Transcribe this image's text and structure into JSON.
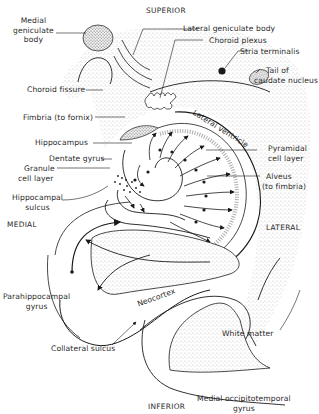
{
  "diagram": {
    "orientation": {
      "superior": "SUPERIOR",
      "inferior": "INFERIOR",
      "medial": "MEDIAL",
      "lateral": "LATERAL"
    },
    "labels": {
      "medial_geniculate_body": [
        "Medial",
        "geniculate",
        "body"
      ],
      "lateral_geniculate_body": "Lateral geniculate body",
      "choroid_plexus": "Choroid plexus",
      "stria_terminalis": "Stria terminalis",
      "tail_of_caudate_nucleus": [
        "Tail of",
        "caudate nucleus"
      ],
      "choroid_fissure": "Choroid fissure",
      "lateral_ventricle": "Lateral ventricle",
      "fimbria": "Fimbria (to fornix)",
      "hippocampus": "Hippocampus",
      "pyramidal_cell_layer": [
        "Pyramidal",
        "cell layer"
      ],
      "dentate_gyrus": "Dentate gyrus",
      "granule_cell_layer": [
        "Granule",
        "cell layer"
      ],
      "alveus": [
        "Alveus",
        "(to fimbria)"
      ],
      "hippocampal_sulcus": [
        "Hippocampal",
        "sulcus"
      ],
      "parahippocampal_gyrus": [
        "Parahippocampal",
        "gyrus"
      ],
      "neocortex": "Neocortex",
      "white_matter": "White matter",
      "collateral_sulcus": "Collateral sulcus",
      "medial_occipitotemporal_gyrus": [
        "Medial occipitotemporal",
        "gyrus"
      ]
    },
    "colors": {
      "line": "#1a1a1a",
      "stipple": "#9a9a9a",
      "background": "#ffffff"
    }
  }
}
